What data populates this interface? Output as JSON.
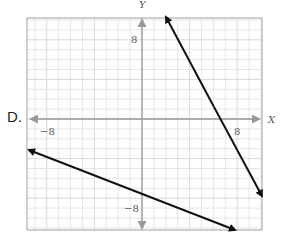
{
  "option": {
    "label": "D."
  },
  "axes": {
    "x_name": "X",
    "y_name": "Y",
    "x_ticks": {
      "neg": "−8",
      "pos": "8"
    },
    "y_ticks": {
      "neg": "−8",
      "pos": "8"
    }
  },
  "chart_data": {
    "type": "line",
    "title": "",
    "xlabel": "X",
    "ylabel": "Y",
    "xlim": [
      -10,
      10
    ],
    "ylim": [
      -11,
      10
    ],
    "grid": true,
    "tick_labels": {
      "x": [
        -8,
        8
      ],
      "y": [
        -8,
        8
      ]
    },
    "series": [
      {
        "name": "steep line",
        "description": "line with arrows at both ends, negative slope ~ -2.2",
        "x": [
          2,
          10.1
        ],
        "y": [
          10.3,
          -7.8
        ]
      },
      {
        "name": "shallow line",
        "description": "line with arrows at both ends, negative slope ~ -0.47, y-intercept ~ -7.5",
        "x": [
          -9.5,
          7.8
        ],
        "y": [
          -3.1,
          -11.2
        ]
      }
    ]
  }
}
